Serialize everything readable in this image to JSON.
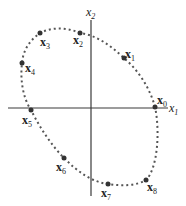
{
  "diagram": {
    "type": "closed curve of iterates in the x1-x2 plane",
    "axes": {
      "horizontal": {
        "label": "x",
        "subscript": "1"
      },
      "vertical": {
        "label": "x",
        "subscript": "2"
      }
    },
    "points": [
      {
        "name": "x",
        "subscript": "0",
        "x": 155,
        "y": 107,
        "lx": 157,
        "ly": 104
      },
      {
        "name": "x",
        "subscript": "1",
        "x": 124,
        "y": 58,
        "lx": 125,
        "ly": 58
      },
      {
        "name": "x",
        "subscript": "2",
        "x": 80,
        "y": 33,
        "lx": 73,
        "ly": 44
      },
      {
        "name": "x",
        "subscript": "3",
        "x": 40,
        "y": 33,
        "lx": 40,
        "ly": 46
      },
      {
        "name": "x",
        "subscript": "4",
        "x": 22,
        "y": 63,
        "lx": 25,
        "ly": 72
      },
      {
        "name": "x",
        "subscript": "5",
        "x": 31,
        "y": 110,
        "lx": 22,
        "ly": 124
      },
      {
        "name": "x",
        "subscript": "6",
        "x": 64,
        "y": 158,
        "lx": 56,
        "ly": 171
      },
      {
        "name": "x",
        "subscript": "7",
        "x": 108,
        "y": 184,
        "lx": 101,
        "ly": 197
      },
      {
        "name": "x",
        "subscript": "8",
        "x": 146,
        "y": 180,
        "lx": 147,
        "ly": 191
      }
    ]
  }
}
